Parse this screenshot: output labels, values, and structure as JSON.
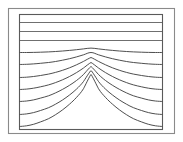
{
  "figure": {
    "kind": "contour-field-diagram",
    "background_color": "#ffffff",
    "outer_frame_color": "#8a8a8a",
    "plot_frame_color": "#5a5a5a",
    "contour_color": "#3a3a3a",
    "flat_contour_color": "#555555"
  },
  "chart_data": {
    "type": "line",
    "title": "",
    "subtitle": "",
    "xlabel": "",
    "ylabel": "",
    "xlim": [
      0,
      143
    ],
    "ylim": [
      0,
      115
    ],
    "grid": false,
    "legend": "none",
    "annotations": [],
    "x": [
      0,
      7,
      14,
      21,
      29,
      36,
      43,
      50,
      57,
      64,
      71.5,
      79,
      86,
      93,
      100,
      107,
      114,
      122,
      129,
      136,
      143
    ],
    "series": [
      {
        "name": "contour-1",
        "shape": "flat",
        "edge_y": 8,
        "apex_y": 8,
        "values": [
          8,
          8,
          8,
          8,
          8,
          8,
          8,
          8,
          8,
          8,
          8,
          8,
          8,
          8,
          8,
          8,
          8,
          8,
          8,
          8,
          8
        ]
      },
      {
        "name": "contour-2",
        "shape": "flat",
        "edge_y": 17,
        "apex_y": 17,
        "values": [
          17,
          17,
          17,
          17,
          17,
          17,
          17,
          17,
          17,
          17,
          17,
          17,
          17,
          17,
          17,
          17,
          17,
          17,
          17,
          17,
          17
        ]
      },
      {
        "name": "contour-3",
        "shape": "flat",
        "edge_y": 26,
        "apex_y": 26,
        "values": [
          26,
          26,
          26,
          26,
          26,
          26,
          26,
          26,
          26,
          26,
          26,
          26,
          26,
          26,
          26,
          26,
          26,
          26,
          26,
          26,
          26
        ]
      },
      {
        "name": "contour-4",
        "shape": "broad-dome",
        "edge_y": 38,
        "apex_y": 33,
        "values": [
          38,
          38,
          37.9,
          37.7,
          37.4,
          37.0,
          36.5,
          35.9,
          35.2,
          34.4,
          33.6,
          34.4,
          35.2,
          35.9,
          36.5,
          37.0,
          37.4,
          37.7,
          37.9,
          38,
          38
        ]
      },
      {
        "name": "contour-5",
        "shape": "dome",
        "edge_y": 50,
        "apex_y": 36,
        "values": [
          50,
          49.8,
          49.4,
          48.8,
          48.0,
          47.0,
          45.7,
          44.2,
          42.4,
          40.3,
          38.0,
          40.3,
          42.4,
          44.2,
          45.7,
          47.0,
          48.0,
          48.8,
          49.4,
          49.8,
          50
        ]
      },
      {
        "name": "contour-6",
        "shape": "peak",
        "edge_y": 63,
        "apex_y": 43,
        "values": [
          63,
          62.7,
          62.0,
          61.0,
          59.6,
          57.9,
          55.8,
          53.3,
          50.3,
          46.9,
          43.0,
          46.9,
          50.3,
          53.3,
          55.8,
          57.9,
          59.6,
          61.0,
          62.0,
          62.7,
          63
        ]
      },
      {
        "name": "contour-7",
        "shape": "sharp-peak",
        "edge_y": 75,
        "apex_y": 48,
        "values": [
          75,
          74.6,
          73.7,
          72.3,
          70.4,
          68.1,
          65.3,
          62.0,
          58.1,
          53.5,
          48.0,
          53.5,
          58.1,
          62.0,
          65.3,
          68.1,
          70.4,
          72.3,
          73.7,
          74.6,
          75
        ]
      },
      {
        "name": "contour-8",
        "shape": "sharp-peak",
        "edge_y": 87,
        "apex_y": 52,
        "values": [
          87,
          86.5,
          85.4,
          83.6,
          81.3,
          78.4,
          74.9,
          70.8,
          66.0,
          60.0,
          52.0,
          60.0,
          66.0,
          70.8,
          74.9,
          78.4,
          81.3,
          83.6,
          85.4,
          86.5,
          87
        ]
      },
      {
        "name": "contour-9",
        "shape": "sharp-peak",
        "edge_y": 100,
        "apex_y": 56,
        "values": [
          100,
          99.4,
          98.1,
          96.0,
          93.2,
          89.7,
          85.5,
          80.5,
          74.6,
          67.0,
          56.0,
          67.0,
          74.6,
          80.5,
          85.5,
          89.7,
          93.2,
          96.0,
          98.1,
          99.4,
          100
        ]
      },
      {
        "name": "contour-10",
        "shape": "sharp-peak",
        "edge_y": 112,
        "apex_y": 60,
        "values": [
          112,
          111.3,
          109.8,
          107.4,
          104.2,
          100.2,
          95.4,
          89.7,
          82.9,
          74.2,
          60.0,
          74.2,
          82.9,
          89.7,
          95.4,
          100.2,
          104.2,
          107.4,
          109.8,
          111.3,
          112
        ]
      }
    ]
  }
}
